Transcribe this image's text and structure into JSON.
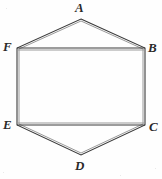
{
  "figure": {
    "kind": "geometric-line-drawing",
    "shape_name": "hexagon",
    "width": 162,
    "height": 179,
    "background_color": "#fefefe",
    "stroke_color": "#3a3a3a",
    "stroke_color_light": "#8a8a8a",
    "stroke_width": 1,
    "line_style": "double-ruled engraving",
    "vertices": [
      {
        "label": "A",
        "x": 81,
        "y": 19,
        "label_x": 75,
        "label_y": 1,
        "position": "top"
      },
      {
        "label": "B",
        "x": 145,
        "y": 48,
        "label_x": 148,
        "label_y": 41,
        "position": "upper-right"
      },
      {
        "label": "C",
        "x": 145,
        "y": 125,
        "label_x": 149,
        "label_y": 120,
        "position": "lower-right"
      },
      {
        "label": "D",
        "x": 81,
        "y": 155,
        "label_x": 75,
        "label_y": 159,
        "position": "bottom"
      },
      {
        "label": "E",
        "x": 17,
        "y": 125,
        "label_x": 3,
        "label_y": 118,
        "position": "lower-left"
      },
      {
        "label": "F",
        "x": 17,
        "y": 48,
        "label_x": 3,
        "label_y": 40,
        "position": "upper-left"
      }
    ],
    "edges": [
      {
        "from": "A",
        "to": "B",
        "orientation": "diagonal"
      },
      {
        "from": "B",
        "to": "C",
        "orientation": "vertical"
      },
      {
        "from": "C",
        "to": "D",
        "orientation": "diagonal"
      },
      {
        "from": "D",
        "to": "E",
        "orientation": "diagonal"
      },
      {
        "from": "E",
        "to": "F",
        "orientation": "vertical"
      },
      {
        "from": "F",
        "to": "A",
        "orientation": "diagonal"
      },
      {
        "from": "F",
        "to": "B",
        "orientation": "horizontal-chord"
      },
      {
        "from": "E",
        "to": "C",
        "orientation": "horizontal-chord"
      }
    ]
  }
}
